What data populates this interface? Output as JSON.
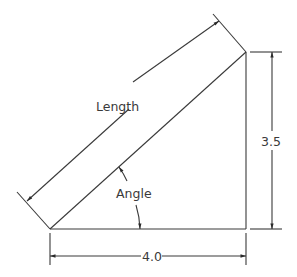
{
  "diagram": {
    "type": "dimensioned-right-triangle",
    "labels": {
      "hypotenuse": "Length",
      "angle": "Angle",
      "height": "3.5",
      "base": "4.0"
    },
    "colors": {
      "line": "#3a3a3a",
      "background": "#ffffff"
    }
  }
}
